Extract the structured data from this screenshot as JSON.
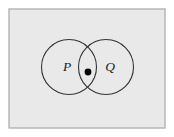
{
  "figure": {
    "kind": "venn-diagram",
    "title": ""
  },
  "canvas": {
    "width": 174,
    "height": 137,
    "page_background": "#ffffff"
  },
  "universe_box": {
    "name": "universal-set",
    "label": "",
    "fill": "#e9e9e9",
    "stroke": "#b3b3b3",
    "stroke_width": 1.4,
    "x": 9,
    "y": 9,
    "width": 156,
    "height": 119
  },
  "sets": [
    {
      "id": "P",
      "label": "P",
      "cx": 69,
      "cy": 67,
      "r": 27.5,
      "stroke": "#333333",
      "stroke_width": 1.1,
      "fill": "none",
      "label_x": 67,
      "label_y": 71
    },
    {
      "id": "Q",
      "label": "Q",
      "cx": 106,
      "cy": 67,
      "r": 27.5,
      "stroke": "#333333",
      "stroke_width": 1.1,
      "fill": "none",
      "label_x": 110,
      "label_y": 71
    }
  ],
  "marked_point": {
    "name": "intersection-point",
    "label": "",
    "cx": 88,
    "cy": 72,
    "r": 3.4,
    "fill": "#000000"
  }
}
